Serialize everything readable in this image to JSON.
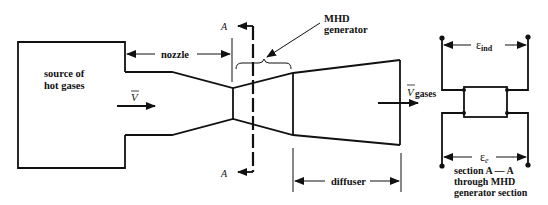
{
  "figure": {
    "colors": {
      "line": "#111111",
      "background": "#ffffff"
    },
    "labels": {
      "source": [
        "source of",
        "hot gases"
      ],
      "velocity_in": "V",
      "nozzle": "nozzle",
      "mhd": [
        "MHD",
        "generator"
      ],
      "section_marker_top": "A",
      "section_marker_bottom": "A",
      "velocity_out": "V",
      "velocity_out_sub": "gases",
      "diffuser": "diffuser",
      "emf_induced": "ε",
      "emf_induced_sub": "ind",
      "emf_external": "ε",
      "emf_external_sub": "e",
      "section_caption": [
        "section A — A",
        "through MHD",
        "generator section"
      ]
    }
  }
}
